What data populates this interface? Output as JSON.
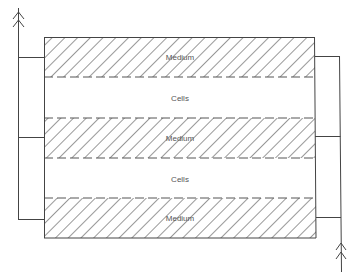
{
  "diagram": {
    "type": "layered-flow-schematic",
    "colors": {
      "line": "#444444",
      "hatch": "#444444",
      "text": "#555555",
      "background": "#ffffff"
    },
    "layers": [
      {
        "id": "layer-1",
        "label": "Medium",
        "kind": "medium",
        "hatched": true
      },
      {
        "id": "layer-2",
        "label": "Cells",
        "kind": "cells",
        "hatched": false
      },
      {
        "id": "layer-3",
        "label": "Medium",
        "kind": "medium",
        "hatched": true
      },
      {
        "id": "layer-4",
        "label": "Cells",
        "kind": "cells",
        "hatched": false
      },
      {
        "id": "layer-5",
        "label": "Medium",
        "kind": "medium",
        "hatched": true
      }
    ],
    "left_manifold": {
      "direction": "up",
      "arrow_icon": "double-chevron-up",
      "connects_to": [
        "layer-1",
        "layer-3",
        "layer-5"
      ]
    },
    "right_manifold": {
      "direction": "up",
      "arrow_icon": "double-chevron-up",
      "connects_to": [
        "layer-1",
        "layer-3",
        "layer-5"
      ]
    }
  }
}
